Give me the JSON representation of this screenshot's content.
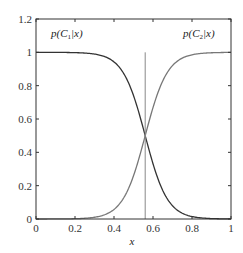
{
  "chart_data": {
    "type": "line",
    "title": "",
    "xlabel": "x",
    "ylabel": "",
    "xlim": [
      0,
      1
    ],
    "ylim": [
      0,
      1.2
    ],
    "grid": false,
    "xticks": [
      "0",
      "0.2",
      "0.4",
      "0.6",
      "0.8",
      "1"
    ],
    "yticks": [
      "0",
      "0.2",
      "0.4",
      "0.6",
      "0.8",
      "1",
      "1.2"
    ],
    "decision_boundary_x": 0.56,
    "series": [
      {
        "name": "p(C1|x)",
        "color": "#333333",
        "x": [
          0,
          0.1,
          0.2,
          0.3,
          0.35,
          0.4,
          0.45,
          0.5,
          0.56,
          0.6,
          0.65,
          0.7,
          0.75,
          0.8,
          0.9,
          1.0
        ],
        "values": [
          1.0,
          1.0,
          1.0,
          0.99,
          0.98,
          0.94,
          0.87,
          0.74,
          0.5,
          0.33,
          0.18,
          0.08,
          0.04,
          0.01,
          0.0,
          0.0
        ]
      },
      {
        "name": "p(C2|x)",
        "color": "#777777",
        "x": [
          0,
          0.1,
          0.2,
          0.3,
          0.35,
          0.4,
          0.45,
          0.5,
          0.56,
          0.6,
          0.65,
          0.7,
          0.75,
          0.8,
          0.9,
          1.0
        ],
        "values": [
          0.0,
          0.0,
          0.0,
          0.01,
          0.02,
          0.06,
          0.13,
          0.26,
          0.5,
          0.67,
          0.82,
          0.92,
          0.96,
          0.99,
          1.0,
          1.0
        ]
      }
    ],
    "annotations": [
      {
        "text": "p(C1|x)",
        "x": 0.12,
        "y": 1.1
      },
      {
        "text": "p(C2|x)",
        "x": 0.86,
        "y": 1.1
      }
    ]
  },
  "labels": {
    "c1_prefix": "p(",
    "c1_cal": "C",
    "c1_sub": "1",
    "c1_suffix": "|x)",
    "c2_prefix": "p(",
    "c2_cal": "C",
    "c2_sub": "2",
    "c2_suffix": "|x)",
    "xlabel": "x"
  }
}
